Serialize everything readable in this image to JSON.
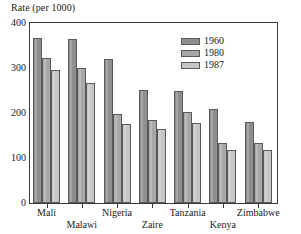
{
  "chart_data": {
    "type": "bar",
    "title": "",
    "ylabel": "Rate (per 1000)",
    "xlabel": "",
    "ylim": [
      0,
      400
    ],
    "yticks": [
      0,
      100,
      200,
      300,
      400
    ],
    "ytick_labels": [
      "0",
      "100",
      "200",
      "300",
      "400"
    ],
    "yminor_step": 50,
    "grid": false,
    "legend_position": "inside-top-right",
    "categories": [
      "Mali",
      "Malawi",
      "Nigeria",
      "Zaire",
      "Tanzania",
      "Kenya",
      "Zimbabwe"
    ],
    "series": [
      {
        "name": "1960",
        "color": "#8e8e8e",
        "values": [
          367,
          364,
          319,
          251,
          248,
          209,
          181
        ]
      },
      {
        "name": "1980",
        "color": "#a8a8a8",
        "values": [
          323,
          301,
          198,
          185,
          202,
          134,
          133
        ]
      },
      {
        "name": "1987",
        "color": "#c6c6c6",
        "values": [
          296,
          267,
          176,
          164,
          177,
          118,
          118
        ]
      }
    ]
  },
  "legend": {
    "items": [
      {
        "label": "1960"
      },
      {
        "label": "1980"
      },
      {
        "label": "1987"
      }
    ]
  },
  "axis": {
    "y_title": "Rate (per 1000)"
  },
  "colors": {
    "series_1960": "#8e8e8e",
    "series_1980": "#a8a8a8",
    "series_1987": "#c6c6c6",
    "frame": "#3b3b3b",
    "background": "#ffffff"
  }
}
